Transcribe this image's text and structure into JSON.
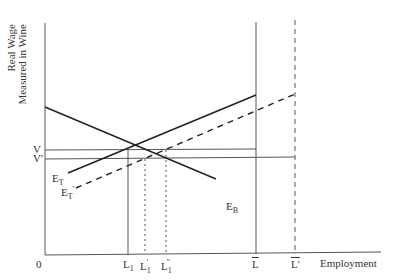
{
  "diagram": {
    "y_axis_label_line1": "Real Wage",
    "y_axis_label_line2": "Measured in Wine",
    "x_axis_label": "Employment",
    "origin_label": "0",
    "wage_labels": {
      "V": "V",
      "V_prime": "V'"
    },
    "curves": {
      "E_T": {
        "base": "E",
        "sub": "T"
      },
      "E_T_prime": {
        "base": "E",
        "sub": "T",
        "prime": "'"
      },
      "E_B": {
        "base": "E",
        "sub": "B"
      }
    },
    "x_labels": {
      "L1": {
        "base": "L",
        "sub": "1"
      },
      "L1_prime": {
        "base": "L",
        "sub": "1",
        "sup": "'"
      },
      "L1_double_prime": {
        "base": "L",
        "sub": "1",
        "sup": "''"
      },
      "L_bar": "L",
      "L_bar_prime": "L'"
    },
    "colors": {
      "line": "#333333",
      "thin": "#555555"
    }
  }
}
